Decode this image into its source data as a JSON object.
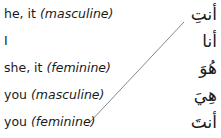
{
  "exercise": {
    "english": [
      {
        "word": "he, it",
        "note": "(masculine)"
      },
      {
        "word": "I",
        "note": ""
      },
      {
        "word": "she, it",
        "note": "(feminine)"
      },
      {
        "word": "you",
        "note": "(masculine)"
      },
      {
        "word": "you",
        "note": "(feminine)"
      }
    ],
    "arabic": [
      "أنتِ",
      "أنا",
      "هُوَ",
      "هِيَ",
      "أنتَ"
    ],
    "matches": [
      {
        "from_english_index": 4,
        "to_arabic_index": 0
      }
    ],
    "line_color": "#888888"
  }
}
